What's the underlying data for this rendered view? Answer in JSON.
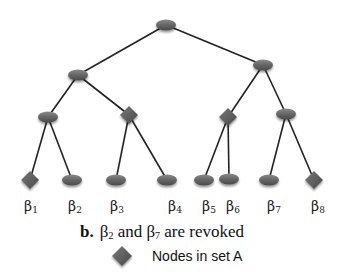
{
  "diagram": {
    "colors": {
      "node": "#6b6b6b",
      "node_dark": "#4a4a4a",
      "edge": "#222222"
    },
    "nodes": [
      {
        "id": "root",
        "shape": "ellipse",
        "x": 166,
        "y": 25
      },
      {
        "id": "l1a",
        "shape": "ellipse",
        "x": 78,
        "y": 75
      },
      {
        "id": "l1b",
        "shape": "ellipse",
        "x": 263,
        "y": 65
      },
      {
        "id": "l2a",
        "shape": "ellipse",
        "x": 48,
        "y": 117
      },
      {
        "id": "l2b",
        "shape": "diamond",
        "x": 129,
        "y": 115
      },
      {
        "id": "l2c",
        "shape": "diamond",
        "x": 228,
        "y": 117
      },
      {
        "id": "l2d",
        "shape": "ellipse",
        "x": 286,
        "y": 114
      },
      {
        "id": "b1",
        "shape": "diamond",
        "x": 30,
        "y": 180
      },
      {
        "id": "b2",
        "shape": "ellipse",
        "x": 72,
        "y": 180
      },
      {
        "id": "b3",
        "shape": "ellipse",
        "x": 116,
        "y": 180
      },
      {
        "id": "b4",
        "shape": "ellipse",
        "x": 167,
        "y": 180
      },
      {
        "id": "b5",
        "shape": "ellipse",
        "x": 204,
        "y": 180
      },
      {
        "id": "b6",
        "shape": "ellipse",
        "x": 229,
        "y": 179
      },
      {
        "id": "b7",
        "shape": "ellipse",
        "x": 269,
        "y": 180
      },
      {
        "id": "b8",
        "shape": "diamond",
        "x": 314,
        "y": 180
      }
    ],
    "edges": [
      [
        "root",
        "l1a"
      ],
      [
        "root",
        "l1b"
      ],
      [
        "l1a",
        "l2a"
      ],
      [
        "l1a",
        "l2b"
      ],
      [
        "l1b",
        "l2c"
      ],
      [
        "l1b",
        "l2d"
      ],
      [
        "l2a",
        "b1"
      ],
      [
        "l2a",
        "b2"
      ],
      [
        "l2b",
        "b3"
      ],
      [
        "l2b",
        "b4"
      ],
      [
        "l2c",
        "b5"
      ],
      [
        "l2c",
        "b6"
      ],
      [
        "l2d",
        "b7"
      ],
      [
        "l2d",
        "b8"
      ]
    ],
    "leaf_labels": [
      {
        "base": "β",
        "sub": "1",
        "x": 31
      },
      {
        "base": "β",
        "sub": "2",
        "x": 75
      },
      {
        "base": "β",
        "sub": "3",
        "x": 117
      },
      {
        "base": "β",
        "sub": "4",
        "x": 175
      },
      {
        "base": "β",
        "sub": "5",
        "x": 209
      },
      {
        "base": "β",
        "sub": "6",
        "x": 233
      },
      {
        "base": "β",
        "sub": "7",
        "x": 274
      },
      {
        "base": "β",
        "sub": "8",
        "x": 318
      }
    ]
  },
  "caption": {
    "label": "b.",
    "part1_base": "β",
    "part1_sub": "2",
    "middle": " and ",
    "part2_base": "β",
    "part2_sub": "7",
    "tail": " are revoked"
  },
  "legend": {
    "icon": "diamond-icon",
    "text": "Nodes in set A"
  }
}
